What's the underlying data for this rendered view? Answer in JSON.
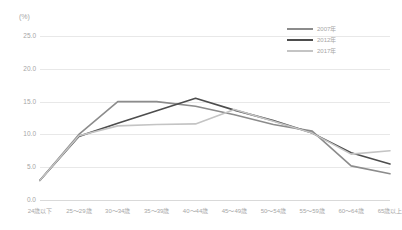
{
  "chart_data": {
    "type": "line",
    "title": "",
    "xlabel": "",
    "ylabel": "(%)",
    "unit_label": "(%)",
    "ylim": [
      0.0,
      25.0
    ],
    "yticks": [
      "0.0",
      "5.0",
      "10.0",
      "15.0",
      "20.0",
      "25.0"
    ],
    "ytick_values": [
      0.0,
      5.0,
      10.0,
      15.0,
      20.0,
      25.0
    ],
    "grid": true,
    "legend_position": "top-right",
    "categories": [
      "24歳以下",
      "25～29歳",
      "30～34歳",
      "35～39歳",
      "40～44歳",
      "45～49歳",
      "50～54歳",
      "55～59歳",
      "60～64歳",
      "65歳以上"
    ],
    "series": [
      {
        "name": "2007年",
        "color": "#8c8c8c",
        "values": [
          3.0,
          10.0,
          15.0,
          15.0,
          14.3,
          13.0,
          11.5,
          10.5,
          5.2,
          4.0
        ]
      },
      {
        "name": "2012年",
        "color": "#4d4d4d",
        "values": [
          3.0,
          9.7,
          11.7,
          13.6,
          15.5,
          13.7,
          12.1,
          10.2,
          7.2,
          5.5
        ]
      },
      {
        "name": "2017年",
        "color": "#c4c4c4",
        "values": [
          3.0,
          9.8,
          11.3,
          11.5,
          11.6,
          13.8,
          12.0,
          10.2,
          7.0,
          7.5
        ]
      }
    ]
  },
  "legend": {
    "items": [
      {
        "label": "2007年",
        "color": "#8c8c8c"
      },
      {
        "label": "2012年",
        "color": "#4d4d4d"
      },
      {
        "label": "2017年",
        "color": "#c4c4c4"
      }
    ]
  }
}
